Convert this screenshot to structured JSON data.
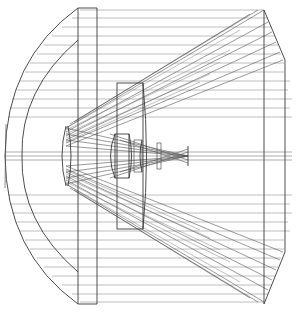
{
  "diagram": {
    "title": "",
    "type": "optical-lens-ray-trace",
    "colors": {
      "background": "#ffffff",
      "lens_stroke": "#3a3a3a",
      "ray_stroke": "#8a8a8a"
    },
    "components": [
      {
        "id": "front-meniscus",
        "label": ""
      },
      {
        "id": "front-element-edge",
        "label": ""
      },
      {
        "id": "secondary-lens",
        "label": ""
      },
      {
        "id": "relay-lens-group",
        "label": ""
      },
      {
        "id": "rear-housing",
        "label": ""
      },
      {
        "id": "focal-point",
        "label": ""
      }
    ],
    "ray_bundles": [
      {
        "id": "upper-oblique-bundle",
        "direction": "converging"
      },
      {
        "id": "axial-bundle",
        "direction": "converging"
      },
      {
        "id": "lower-oblique-bundle",
        "direction": "converging"
      }
    ]
  }
}
